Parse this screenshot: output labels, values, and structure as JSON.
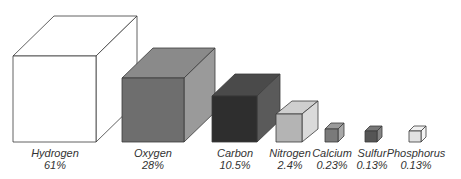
{
  "chart_data": {
    "type": "3d-cube-size-comparison",
    "title": "",
    "categories": [
      "Hydrogen",
      "Oxygen",
      "Carbon",
      "Nitrogen",
      "Calcium",
      "Sulfur",
      "Phosphorus"
    ],
    "values_percent": [
      61,
      28,
      10.5,
      2.4,
      0.23,
      0.13,
      0.13
    ],
    "value_labels": [
      "61%",
      "28%",
      "10.5%",
      "2.4%",
      "0.23%",
      "0.13%",
      "0.13%"
    ]
  },
  "cubes": [
    {
      "name": "Hydrogen",
      "pct": "61%",
      "x": 13,
      "w": 83,
      "h": 86,
      "dx": 41,
      "dy": 40,
      "front": "#ffffff",
      "top": "#ffffff",
      "side": "#ffffff",
      "labelX": 55
    },
    {
      "name": "Oxygen",
      "pct": "28%",
      "x": 122,
      "w": 62,
      "h": 64,
      "dx": 31,
      "dy": 30,
      "front": "#6e6e6e",
      "top": "#8a8a8a",
      "side": "#9a9a9a",
      "labelX": 153
    },
    {
      "name": "Carbon",
      "pct": "10.5%",
      "x": 212,
      "w": 45,
      "h": 46,
      "dx": 23,
      "dy": 22,
      "front": "#2e2e2e",
      "top": "#4a4a4a",
      "side": "#5a5a5a",
      "labelX": 235
    },
    {
      "name": "Nitrogen",
      "pct": "2.4%",
      "x": 276,
      "w": 26,
      "h": 28,
      "dx": 16,
      "dy": 13,
      "front": "#b4b4b4",
      "top": "#cfcfcf",
      "side": "#dadada",
      "labelX": 290
    },
    {
      "name": "Calcium",
      "pct": "0.23%",
      "x": 325,
      "w": 13,
      "h": 13,
      "dx": 6,
      "dy": 6,
      "front": "#7a7a7a",
      "top": "#9a9a9a",
      "side": "#a8a8a8",
      "labelX": 332
    },
    {
      "name": "Sulfur",
      "pct": "0.13%",
      "x": 365,
      "w": 12,
      "h": 11,
      "dx": 5,
      "dy": 5,
      "front": "#555555",
      "top": "#777777",
      "side": "#858585",
      "labelX": 372
    },
    {
      "name": "Phosphorus",
      "pct": "0.13%",
      "x": 409,
      "w": 12,
      "h": 11,
      "dx": 5,
      "dy": 5,
      "front": "#e2e2e2",
      "top": "#f0f0f0",
      "side": "#f4f4f4",
      "labelX": 416
    }
  ],
  "baseline_y": 142,
  "label_top": 147,
  "stroke": "#3a3a3a"
}
